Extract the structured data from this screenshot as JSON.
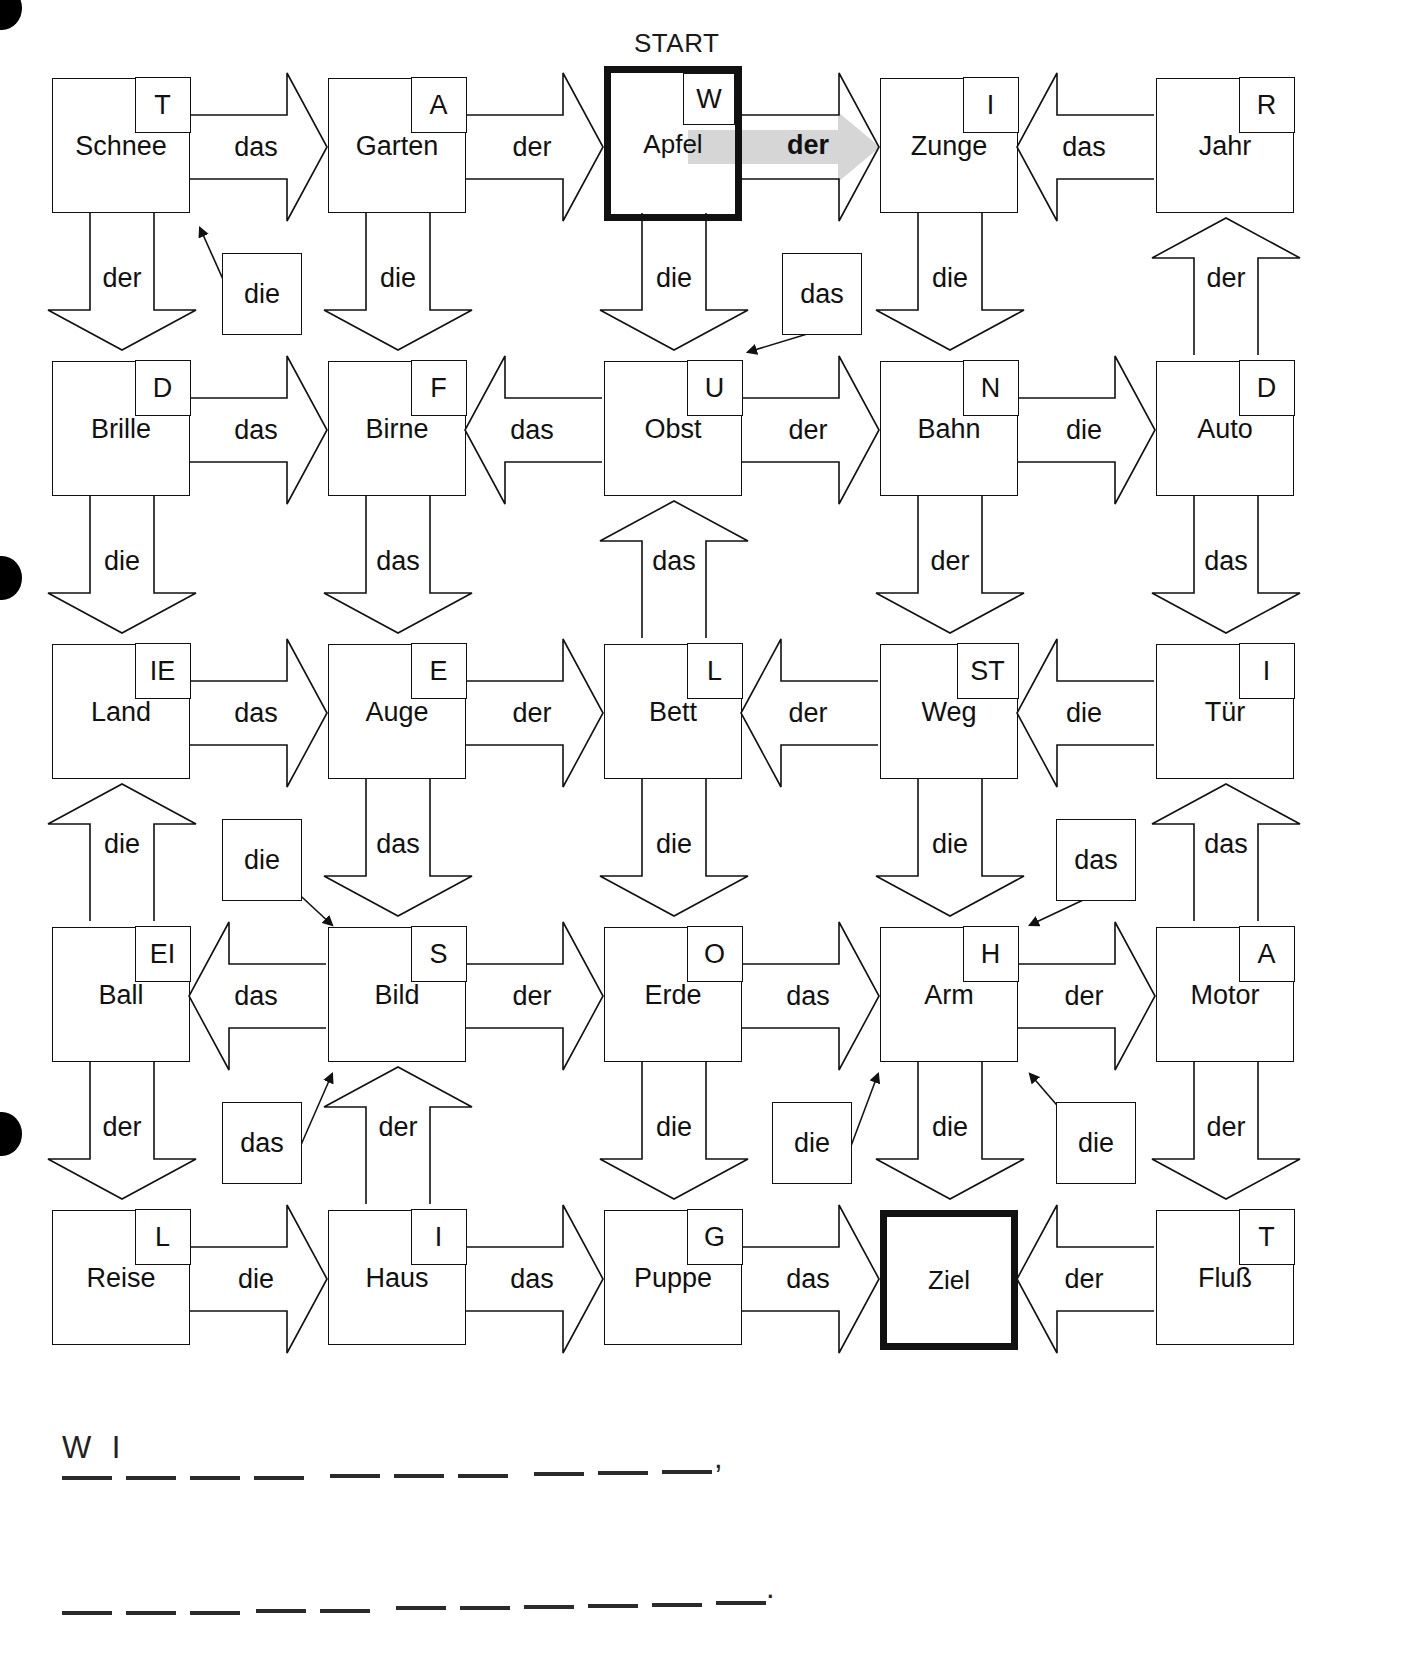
{
  "page": {
    "header_text": "",
    "start_label": "START",
    "hole_punches": 3
  },
  "grid": {
    "rows": 5,
    "cols": 5,
    "cells": [
      [
        {
          "word": "Schnee",
          "letter": "T",
          "bold": false
        },
        {
          "word": "Garten",
          "letter": "A",
          "bold": false
        },
        {
          "word": "Apfel",
          "letter": "W",
          "bold": true
        },
        {
          "word": "Zunge",
          "letter": "I",
          "bold": false
        },
        {
          "word": "Jahr",
          "letter": "R",
          "bold": false
        }
      ],
      [
        {
          "word": "Brille",
          "letter": "D",
          "bold": false
        },
        {
          "word": "Birne",
          "letter": "F",
          "bold": false
        },
        {
          "word": "Obst",
          "letter": "U",
          "bold": false
        },
        {
          "word": "Bahn",
          "letter": "N",
          "bold": false
        },
        {
          "word": "Auto",
          "letter": "D",
          "bold": false
        }
      ],
      [
        {
          "word": "Land",
          "letter": "IE",
          "bold": false
        },
        {
          "word": "Auge",
          "letter": "E",
          "bold": false
        },
        {
          "word": "Bett",
          "letter": "L",
          "bold": false
        },
        {
          "word": "Weg",
          "letter": "ST",
          "bold": false
        },
        {
          "word": "Tür",
          "letter": "I",
          "bold": false
        }
      ],
      [
        {
          "word": "Ball",
          "letter": "EI",
          "bold": false
        },
        {
          "word": "Bild",
          "letter": "S",
          "bold": false
        },
        {
          "word": "Erde",
          "letter": "O",
          "bold": false
        },
        {
          "word": "Arm",
          "letter": "H",
          "bold": false
        },
        {
          "word": "Motor",
          "letter": "A",
          "bold": false
        }
      ],
      [
        {
          "word": "Reise",
          "letter": "L",
          "bold": false
        },
        {
          "word": "Haus",
          "letter": "I",
          "bold": false
        },
        {
          "word": "Puppe",
          "letter": "G",
          "bold": false
        },
        {
          "word": "Ziel",
          "letter": "",
          "bold": true
        },
        {
          "word": "Fluß",
          "letter": "T",
          "bold": false
        }
      ]
    ]
  },
  "horizontal_arrows": [
    {
      "row": 1,
      "from": "Schnee",
      "to": "Garten",
      "article": "das",
      "dir": "right",
      "highlight": false
    },
    {
      "row": 1,
      "from": "Garten",
      "to": "Apfel",
      "article": "der",
      "dir": "right",
      "highlight": false
    },
    {
      "row": 1,
      "from": "Apfel",
      "to": "Zunge",
      "article": "der",
      "dir": "right",
      "highlight": true
    },
    {
      "row": 1,
      "from": "Jahr",
      "to": "Zunge",
      "article": "das",
      "dir": "left",
      "highlight": false
    },
    {
      "row": 2,
      "from": "Brille",
      "to": "Birne",
      "article": "das",
      "dir": "right",
      "highlight": false
    },
    {
      "row": 2,
      "from": "Obst",
      "to": "Birne",
      "article": "das",
      "dir": "left",
      "highlight": false
    },
    {
      "row": 2,
      "from": "Obst",
      "to": "Bahn",
      "article": "der",
      "dir": "right",
      "highlight": false
    },
    {
      "row": 2,
      "from": "Bahn",
      "to": "Auto",
      "article": "die",
      "dir": "right",
      "highlight": false
    },
    {
      "row": 3,
      "from": "Land",
      "to": "Auge",
      "article": "das",
      "dir": "right",
      "highlight": false
    },
    {
      "row": 3,
      "from": "Auge",
      "to": "Bett",
      "article": "der",
      "dir": "right",
      "highlight": false
    },
    {
      "row": 3,
      "from": "Weg",
      "to": "Bett",
      "article": "der",
      "dir": "left",
      "highlight": false
    },
    {
      "row": 3,
      "from": "Tür",
      "to": "Weg",
      "article": "die",
      "dir": "left",
      "highlight": false
    },
    {
      "row": 4,
      "from": "Bild",
      "to": "Ball",
      "article": "das",
      "dir": "left",
      "highlight": false
    },
    {
      "row": 4,
      "from": "Bild",
      "to": "Erde",
      "article": "der",
      "dir": "right",
      "highlight": false
    },
    {
      "row": 4,
      "from": "Erde",
      "to": "Arm",
      "article": "das",
      "dir": "right",
      "highlight": false
    },
    {
      "row": 4,
      "from": "Arm",
      "to": "Motor",
      "article": "der",
      "dir": "right",
      "highlight": false
    },
    {
      "row": 5,
      "from": "Reise",
      "to": "Haus",
      "article": "die",
      "dir": "right",
      "highlight": false
    },
    {
      "row": 5,
      "from": "Haus",
      "to": "Puppe",
      "article": "das",
      "dir": "right",
      "highlight": false
    },
    {
      "row": 5,
      "from": "Puppe",
      "to": "Ziel",
      "article": "das",
      "dir": "right",
      "highlight": false
    },
    {
      "row": 5,
      "from": "Fluß",
      "to": "Ziel",
      "article": "der",
      "dir": "left",
      "highlight": false
    }
  ],
  "vertical_arrows": [
    {
      "col": 1,
      "from": "Schnee",
      "to": "Brille",
      "article": "der",
      "dir": "down"
    },
    {
      "col": 2,
      "from": "Garten",
      "to": "Birne",
      "article": "die",
      "dir": "down"
    },
    {
      "col": 3,
      "from": "Apfel",
      "to": "Obst",
      "article": "die",
      "dir": "down"
    },
    {
      "col": 4,
      "from": "Zunge",
      "to": "Bahn",
      "article": "die",
      "dir": "down"
    },
    {
      "col": 5,
      "from": "Auto",
      "to": "Jahr",
      "article": "der",
      "dir": "up"
    },
    {
      "col": 1,
      "from": "Brille",
      "to": "Land",
      "article": "die",
      "dir": "down"
    },
    {
      "col": 2,
      "from": "Birne",
      "to": "Auge",
      "article": "das",
      "dir": "down"
    },
    {
      "col": 3,
      "from": "Bett",
      "to": "Obst",
      "article": "das",
      "dir": "up"
    },
    {
      "col": 4,
      "from": "Bahn",
      "to": "Weg",
      "article": "der",
      "dir": "down"
    },
    {
      "col": 5,
      "from": "Auto",
      "to": "Tür",
      "article": "das",
      "dir": "down"
    },
    {
      "col": 1,
      "from": "Ball",
      "to": "Land",
      "article": "die",
      "dir": "up"
    },
    {
      "col": 2,
      "from": "Auge",
      "to": "Bild",
      "article": "das",
      "dir": "down"
    },
    {
      "col": 3,
      "from": "Bett",
      "to": "Erde",
      "article": "die",
      "dir": "down"
    },
    {
      "col": 4,
      "from": "Weg",
      "to": "Arm",
      "article": "die",
      "dir": "down"
    },
    {
      "col": 5,
      "from": "Motor",
      "to": "Tür",
      "article": "das",
      "dir": "up"
    },
    {
      "col": 1,
      "from": "Ball",
      "to": "Reise",
      "article": "der",
      "dir": "down"
    },
    {
      "col": 2,
      "from": "Haus",
      "to": "Bild",
      "article": "der",
      "dir": "up"
    },
    {
      "col": 3,
      "from": "Erde",
      "to": "Puppe",
      "article": "die",
      "dir": "down"
    },
    {
      "col": 4,
      "from": "Arm",
      "to": "Ziel",
      "article": "die",
      "dir": "down"
    },
    {
      "col": 5,
      "from": "Motor",
      "to": "Fluß",
      "article": "der",
      "dir": "down"
    }
  ],
  "diagonal_arrows": [
    {
      "from": "Birne",
      "to": "Schnee",
      "article": "die"
    },
    {
      "from": "Bahn",
      "to": "Obst",
      "article": "das"
    },
    {
      "from": "Land",
      "to": "Bild",
      "article": "die"
    },
    {
      "from": "Tür",
      "to": "Arm",
      "article": "das"
    },
    {
      "from": "Reise",
      "to": "Bild",
      "article": "das"
    },
    {
      "from": "Puppe",
      "to": "Arm",
      "article": "die"
    },
    {
      "from": "Fluß",
      "to": "Arm",
      "article": "die"
    }
  ],
  "answer": {
    "line1_prefix": "W  I",
    "line1_end_punctuation": ",",
    "line2_end_punctuation": ".",
    "line1_blank_groups": [
      2,
      3,
      4,
      3,
      4
    ],
    "line2_blank_groups": [
      3,
      2,
      4,
      5,
      2
    ]
  }
}
